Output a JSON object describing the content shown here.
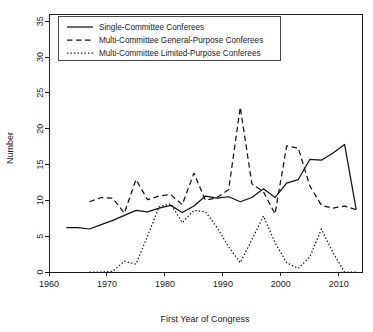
{
  "chart_data": {
    "type": "line",
    "title": "",
    "xlabel": "First Year of Congress",
    "ylabel": "Number",
    "xlim": [
      1960,
      2014
    ],
    "ylim": [
      0,
      36
    ],
    "xticks": [
      1960,
      1970,
      1980,
      1990,
      2000,
      2010
    ],
    "yticks": [
      0,
      5,
      10,
      15,
      20,
      25,
      30,
      35
    ],
    "grid": false,
    "legend_position": "top-left",
    "series": [
      {
        "name": "Single-Committee Conferees",
        "style": "solid",
        "x": [
          1963,
          1965,
          1967,
          1969,
          1971,
          1973,
          1975,
          1977,
          1979,
          1981,
          1983,
          1985,
          1987,
          1989,
          1991,
          1993,
          1995,
          1997,
          1999,
          2001,
          2003,
          2005,
          2007,
          2009,
          2011,
          2013
        ],
        "values": [
          6.2,
          6.2,
          6.0,
          6.6,
          7.2,
          7.9,
          8.6,
          8.4,
          8.9,
          9.3,
          8.3,
          9.2,
          10.6,
          10.3,
          10.5,
          9.8,
          10.4,
          11.6,
          10.4,
          12.4,
          12.9,
          15.7,
          15.6,
          16.6,
          17.8,
          8.7
        ]
      },
      {
        "name": "Multi-Committee General-Purpose Conferees",
        "style": "dashed",
        "x": [
          1967,
          1969,
          1971,
          1973,
          1975,
          1977,
          1979,
          1981,
          1983,
          1985,
          1987,
          1989,
          1991,
          1993,
          1995,
          1997,
          1999,
          2001,
          2003,
          2005,
          2007,
          2009,
          2011,
          2013
        ],
        "values": [
          9.8,
          10.4,
          10.3,
          8.2,
          12.9,
          10.1,
          10.6,
          10.8,
          9.4,
          13.8,
          10.0,
          10.4,
          11.5,
          23.0,
          12.3,
          11.2,
          8.1,
          17.6,
          17.3,
          12.0,
          9.3,
          8.9,
          9.2,
          8.7
        ]
      },
      {
        "name": "Multi-Committee Limited-Purpose Conferees",
        "style": "dotted",
        "x": [
          1967,
          1969,
          1971,
          1973,
          1975,
          1977,
          1979,
          1981,
          1983,
          1985,
          1987,
          1989,
          1991,
          1993,
          1995,
          1997,
          1999,
          2001,
          2003,
          2005,
          2007,
          2009,
          2011,
          2013
        ],
        "values": [
          0.0,
          0.0,
          0.1,
          1.5,
          1.1,
          5.0,
          9.1,
          9.5,
          6.9,
          8.6,
          8.4,
          6.2,
          3.5,
          1.3,
          4.5,
          7.8,
          4.1,
          1.3,
          0.5,
          2.1,
          6.0,
          2.7,
          0.0,
          0.0
        ]
      }
    ]
  },
  "legend": {
    "items": [
      {
        "label": "Single-Committee Conferees",
        "style": "solid"
      },
      {
        "label": "Multi-Committee General-Purpose Conferees",
        "style": "dashed"
      },
      {
        "label": "Multi-Committee Limited-Purpose Conferees",
        "style": "dotted"
      }
    ]
  }
}
